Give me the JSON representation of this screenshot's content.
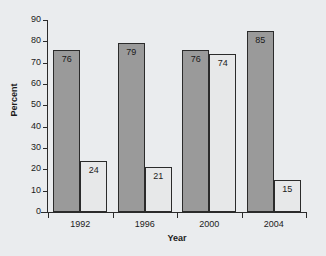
{
  "chart_data": {
    "type": "bar",
    "title": "",
    "xlabel": "Year",
    "ylabel": "Percent",
    "categories": [
      "1992",
      "1996",
      "2000",
      "2004"
    ],
    "series": [
      {
        "name": "dark",
        "values": [
          76,
          79,
          76,
          85
        ],
        "color": "#9a9a9a"
      },
      {
        "name": "light",
        "values": [
          24,
          21,
          74,
          15
        ],
        "color": "#e7e8e9"
      }
    ],
    "ylim": [
      0,
      90
    ],
    "ytick_labels": [
      "0",
      "10",
      "20",
      "30",
      "40",
      "50",
      "60",
      "70",
      "80",
      "90"
    ],
    "ytick_values": [
      0,
      10,
      20,
      30,
      40,
      50,
      60,
      70,
      80,
      90
    ],
    "grid": false,
    "legend": "none",
    "bar_labels": [
      [
        "76",
        "24"
      ],
      [
        "79",
        "21"
      ],
      [
        "76",
        "74"
      ],
      [
        "85",
        "15"
      ]
    ]
  },
  "axes": {
    "y_title": "Percent",
    "x_title": "Year"
  },
  "title_strip": {
    "clipped_text": ""
  }
}
